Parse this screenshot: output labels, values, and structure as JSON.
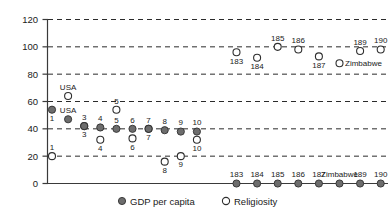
{
  "chart_data": {
    "type": "scatter",
    "title": "",
    "xlabel": "",
    "ylabel": "",
    "ylim": [
      0,
      120
    ],
    "ytick_labels": [
      "0",
      "20",
      "40",
      "60",
      "80",
      "100",
      "120"
    ],
    "ytick_values": [
      0,
      20,
      40,
      60,
      80,
      100,
      120
    ],
    "grid": "horizontal dashed gridlines at each y tick",
    "xaxis": "country rank order (ticks not labeled; points annotated individually)",
    "legend": {
      "position": "bottom-center",
      "entries": [
        {
          "name": "GDP per capita",
          "marker": "filled-circle",
          "color": "#6d6d6d"
        },
        {
          "name": "Religiosity",
          "marker": "open-circle",
          "color": "#ffffff"
        }
      ]
    },
    "series": [
      {
        "name": "GDP per capita",
        "marker": "filled-circle",
        "points": [
          {
            "label": "1",
            "label_pos": "below",
            "x": 1,
            "y": 54
          },
          {
            "label": "USA",
            "label_pos": "above",
            "x": 2,
            "y": 47
          },
          {
            "label": "3",
            "label_pos": "above",
            "x": 3,
            "y": 42
          },
          {
            "label": "4",
            "label_pos": "above",
            "x": 4,
            "y": 41
          },
          {
            "label": "5",
            "label_pos": "above",
            "x": 5,
            "y": 40
          },
          {
            "label": "6",
            "label_pos": "above",
            "x": 6,
            "y": 40
          },
          {
            "label": "7",
            "label_pos": "above",
            "x": 7,
            "y": 40
          },
          {
            "label": "8",
            "label_pos": "above",
            "x": 8,
            "y": 39
          },
          {
            "label": "9",
            "label_pos": "above",
            "x": 9,
            "y": 38
          },
          {
            "label": "10",
            "label_pos": "above",
            "x": 10,
            "y": 38
          },
          {
            "label": "183",
            "label_pos": "above",
            "x": 183,
            "y": 0
          },
          {
            "label": "184",
            "label_pos": "above",
            "x": 184,
            "y": 0
          },
          {
            "label": "185",
            "label_pos": "above",
            "x": 185,
            "y": 0
          },
          {
            "label": "186",
            "label_pos": "above",
            "x": 186,
            "y": 0
          },
          {
            "label": "187",
            "label_pos": "above",
            "x": 187,
            "y": 0
          },
          {
            "label": "Zimbabwe",
            "label_pos": "above",
            "x": 188,
            "y": 0
          },
          {
            "label": "189",
            "label_pos": "above",
            "x": 189,
            "y": 0
          },
          {
            "label": "190",
            "label_pos": "above",
            "x": 190,
            "y": 0
          }
        ]
      },
      {
        "name": "Religiosity",
        "marker": "open-circle",
        "points": [
          {
            "label": "1",
            "label_pos": "above",
            "x": 1,
            "y": 20
          },
          {
            "label": "USA",
            "label_pos": "above",
            "x": 2,
            "y": 64
          },
          {
            "label": "3",
            "label_pos": "below",
            "x": 3,
            "y": 42
          },
          {
            "label": "4",
            "label_pos": "below",
            "x": 4,
            "y": 32
          },
          {
            "label": "5",
            "label_pos": "above",
            "x": 5,
            "y": 54
          },
          {
            "label": "6",
            "label_pos": "below",
            "x": 6,
            "y": 33
          },
          {
            "label": "7",
            "label_pos": "below",
            "x": 7,
            "y": 40
          },
          {
            "label": "8",
            "label_pos": "below",
            "x": 8,
            "y": 16
          },
          {
            "label": "9",
            "label_pos": "below",
            "x": 9,
            "y": 20
          },
          {
            "label": "10",
            "label_pos": "below",
            "x": 10,
            "y": 32
          },
          {
            "label": "183",
            "label_pos": "below",
            "x": 183,
            "y": 96
          },
          {
            "label": "184",
            "label_pos": "below",
            "x": 184,
            "y": 92
          },
          {
            "label": "185",
            "label_pos": "above",
            "x": 185,
            "y": 100
          },
          {
            "label": "186",
            "label_pos": "above",
            "x": 186,
            "y": 98
          },
          {
            "label": "187",
            "label_pos": "below",
            "x": 187,
            "y": 93
          },
          {
            "label": "Zimbabwe",
            "label_pos": "right",
            "x": 188,
            "y": 88
          },
          {
            "label": "189",
            "label_pos": "above",
            "x": 189,
            "y": 97
          },
          {
            "label": "190",
            "label_pos": "above",
            "x": 190,
            "y": 98
          }
        ]
      }
    ]
  }
}
